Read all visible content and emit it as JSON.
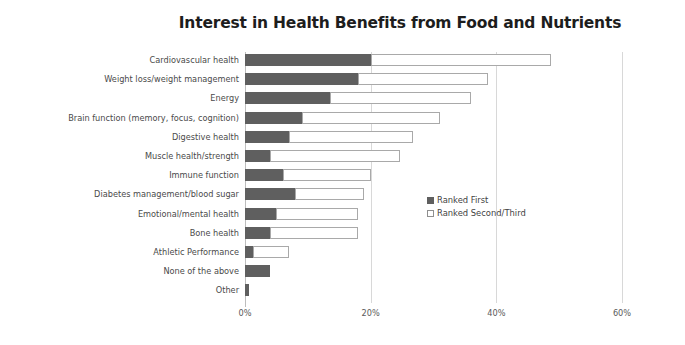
{
  "chart_data": {
    "type": "bar",
    "orientation": "horizontal",
    "stacked": true,
    "title": "Interest in Health Benefits from Food and Nutrients",
    "xlabel": "",
    "ylabel": "",
    "xlim": [
      0,
      60
    ],
    "xunit": "%",
    "xticks": [
      "0%",
      "20%",
      "40%",
      "60%"
    ],
    "xtick_values": [
      0,
      20,
      40,
      60
    ],
    "grid": "vertical",
    "legend_position": "inside-right-middle",
    "categories": [
      "Cardiovascular health",
      "Weight loss/weight management",
      "Energy",
      "Brain function (memory, focus, cognition)",
      "Digestive health",
      "Muscle health/strength",
      "Immune function",
      "Diabetes management/blood sugar",
      "Emotional/mental health",
      "Bone health",
      "Athletic Performance",
      "None of the above",
      "Other"
    ],
    "series": [
      {
        "name": "Ranked First",
        "color": "#5f5f5f",
        "values": [
          20.0,
          18.0,
          13.5,
          9.0,
          7.0,
          4.0,
          6.0,
          8.0,
          5.0,
          4.0,
          1.3,
          4.0,
          0.7
        ]
      },
      {
        "name": "Ranked Second/Third",
        "color": "#ffffff",
        "values": [
          28.7,
          20.7,
          22.5,
          22.0,
          19.8,
          20.7,
          14.0,
          11.0,
          13.0,
          14.0,
          5.7,
          0.0,
          0.0
        ]
      }
    ],
    "totals": [
      48.7,
      38.7,
      36.0,
      31.0,
      26.8,
      24.7,
      20.0,
      19.0,
      18.0,
      18.0,
      7.0,
      4.0,
      0.7
    ]
  },
  "legend": {
    "items": [
      {
        "label": "Ranked First",
        "swatch": "filled-square-icon"
      },
      {
        "label": "Ranked Second/Third",
        "swatch": "hollow-square-icon"
      }
    ]
  }
}
